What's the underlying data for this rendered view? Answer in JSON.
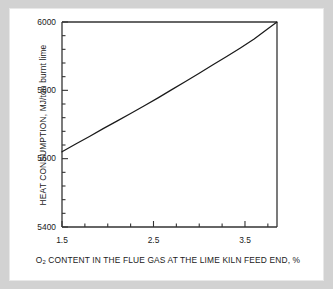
{
  "figure": {
    "background_color": "#d2d2d2",
    "plot_background_color": "#ffffff",
    "line_color": "#1a1a1a",
    "axis_color": "#333333"
  },
  "chart_data": {
    "type": "line",
    "title": "",
    "xlabel_prefix": "O",
    "xlabel_sub": "2",
    "xlabel_rest": " CONTENT IN THE FLUE GAS AT THE LIME KILN FEED END, %",
    "xlabel": "O2 CONTENT IN THE FLUE GAS AT THE LIME KILN FEED END, %",
    "ylabel": "HEAT CONSUMPTION, MJ/ton burnt lime",
    "xlim": [
      1.5,
      3.85
    ],
    "ylim": [
      5400,
      6000
    ],
    "xticks": [
      1.5,
      2.5,
      3.5
    ],
    "xtick_labels": [
      "1.5",
      "2.5",
      "3.5"
    ],
    "xtick_minor_step": 0.25,
    "yticks": [
      5400,
      5600,
      5800,
      6000
    ],
    "ytick_labels": [
      "5400",
      "5600",
      "5800",
      "6000"
    ],
    "ytick_minor_step": 40,
    "grid": false,
    "legend": null,
    "series": [
      {
        "name": "Heat consumption vs O2 content",
        "x": [
          1.5,
          1.65,
          1.8,
          1.95,
          2.1,
          2.25,
          2.4,
          2.55,
          2.7,
          2.85,
          3.0,
          3.15,
          3.3,
          3.45,
          3.6,
          3.75,
          3.85
        ],
        "y": [
          5620,
          5643,
          5665,
          5688,
          5710,
          5732,
          5755,
          5778,
          5802,
          5826,
          5850,
          5875,
          5899,
          5924,
          5950,
          5980,
          6000
        ]
      }
    ]
  }
}
